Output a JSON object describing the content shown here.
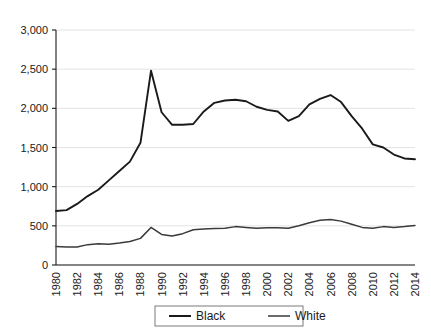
{
  "chart_data": {
    "type": "line",
    "title": "",
    "subtitle": "",
    "xlabel": "",
    "ylabel": "",
    "grid": true,
    "legend_position": "bottom",
    "xlim": [
      1980,
      2014
    ],
    "ylim": [
      0,
      3000
    ],
    "yticks": [
      0,
      500,
      1000,
      1500,
      2000,
      2500,
      3000
    ],
    "ytick_labels": [
      "0",
      "500",
      "1,000",
      "1,500",
      "2,000",
      "2,500",
      "3,000"
    ],
    "xticks": [
      1980,
      1982,
      1984,
      1986,
      1988,
      1990,
      1992,
      1994,
      1996,
      1998,
      2000,
      2002,
      2004,
      2006,
      2008,
      2010,
      2012,
      2014
    ],
    "xtick_labels": [
      "1980",
      "1982",
      "1984",
      "1986",
      "1988",
      "1990",
      "1992",
      "1994",
      "1996",
      "1998",
      "2000",
      "2002",
      "2004",
      "2006",
      "2008",
      "2010",
      "2012",
      "2014"
    ],
    "x": [
      1980,
      1981,
      1982,
      1983,
      1984,
      1985,
      1986,
      1987,
      1988,
      1989,
      1990,
      1991,
      1992,
      1993,
      1994,
      1995,
      1996,
      1997,
      1998,
      1999,
      2000,
      2001,
      2002,
      2003,
      2004,
      2005,
      2006,
      2007,
      2008,
      2009,
      2010,
      2011,
      2012,
      2013,
      2014
    ],
    "series": [
      {
        "name": "Black",
        "color": "#1a1a1a",
        "values": [
          690,
          700,
          780,
          880,
          960,
          1080,
          1200,
          1320,
          1560,
          2480,
          1950,
          1790,
          1790,
          1800,
          1960,
          2070,
          2100,
          2110,
          2090,
          2020,
          1980,
          1960,
          1840,
          1900,
          2050,
          2120,
          2170,
          2080,
          1900,
          1740,
          1540,
          1500,
          1410,
          1360,
          1350
        ]
      },
      {
        "name": "White",
        "color": "#3a3a3a",
        "values": [
          235,
          230,
          230,
          260,
          270,
          265,
          280,
          300,
          340,
          480,
          390,
          370,
          400,
          450,
          460,
          465,
          470,
          490,
          480,
          470,
          475,
          475,
          470,
          500,
          540,
          570,
          580,
          560,
          520,
          480,
          470,
          490,
          480,
          490,
          505
        ]
      }
    ],
    "legend": [
      {
        "label": "Black",
        "color": "#1a1a1a"
      },
      {
        "label": "White",
        "color": "#3a3a3a"
      }
    ]
  }
}
